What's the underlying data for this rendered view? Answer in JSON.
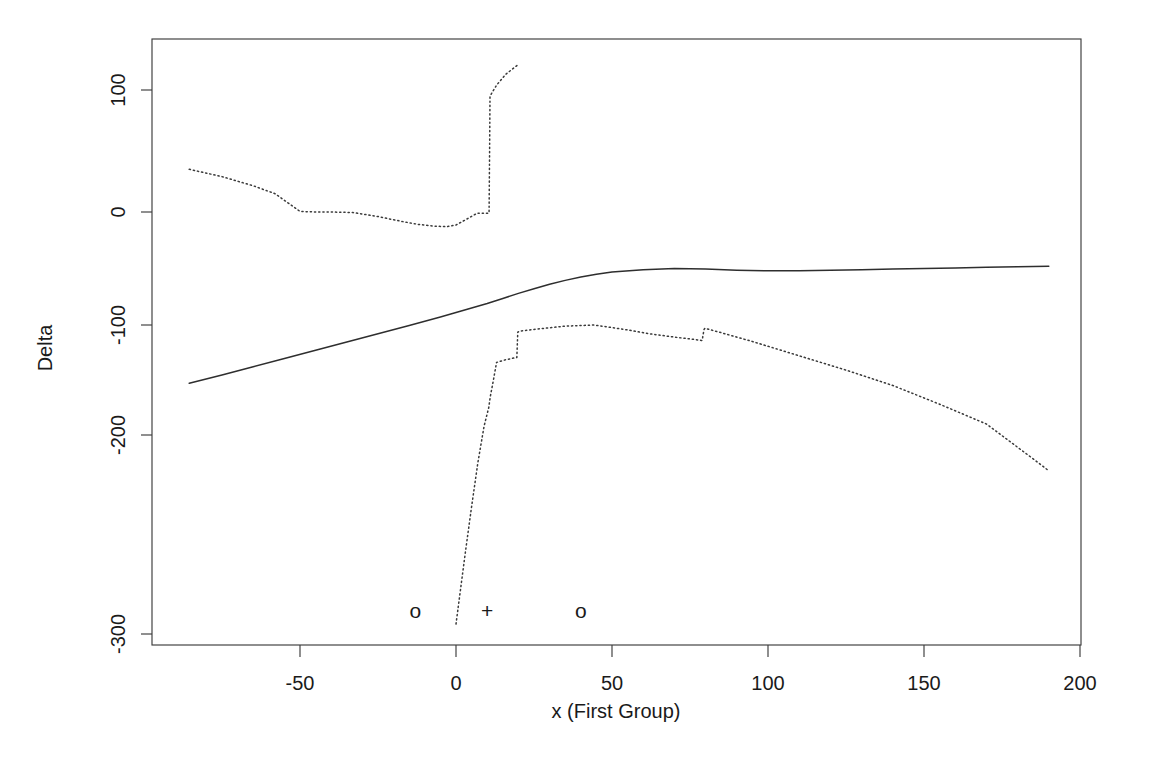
{
  "chart_data": {
    "type": "line",
    "title": "",
    "xlabel": "x (First Group)",
    "ylabel": "Delta",
    "xlim": [
      -95,
      203
    ],
    "ylim": [
      -335,
      128
    ],
    "grid": false,
    "legend": "none",
    "xticks": [
      -50,
      0,
      50,
      100,
      150,
      200
    ],
    "xtick_labels": [
      "-50",
      "0",
      "50",
      "100",
      "150",
      "200"
    ],
    "yticks": [
      100,
      0,
      -100,
      -200,
      -300
    ],
    "ytick_labels": [
      "100",
      "0",
      "-100",
      "-200",
      "-300"
    ],
    "series": [
      {
        "name": "estimate",
        "style": "solid",
        "x": [
          -85.5,
          -75,
          -65,
          -55,
          -45,
          -35,
          -25,
          -15,
          -5,
          0,
          5,
          10,
          15,
          20,
          25,
          30,
          35,
          40,
          45,
          50,
          60,
          70,
          80,
          90,
          100,
          110,
          120,
          130,
          140,
          150,
          160,
          170,
          180,
          190
        ],
        "values": [
          -153.0,
          -145.5,
          -138.0,
          -130.5,
          -123.0,
          -115.5,
          -108.0,
          -100.5,
          -93.0,
          -89.0,
          -85.0,
          -81.0,
          -76.5,
          -72.0,
          -68.0,
          -64.0,
          -60.5,
          -57.5,
          -55.0,
          -53.0,
          -51.0,
          -50.0,
          -50.5,
          -51.5,
          -52.0,
          -52.0,
          -51.5,
          -51.0,
          -50.5,
          -50.0,
          -49.5,
          -49.0,
          -48.5,
          -48.0
        ]
      },
      {
        "name": "upper confidence band",
        "style": "dotted",
        "x": [
          -85.5,
          -75,
          -65,
          -58,
          -50,
          -45,
          -40,
          -33,
          -25,
          -18,
          -12,
          -7,
          -3,
          0,
          3,
          6.5,
          6.8,
          9,
          10.6,
          10.8,
          10.9,
          13,
          16,
          20
        ],
        "values": [
          35.0,
          29.0,
          21.5,
          15.0,
          0.5,
          0.0,
          0.0,
          -0.5,
          -4.0,
          -8.0,
          -11.0,
          -12.5,
          -13.0,
          -11.5,
          -7.0,
          -1.5,
          -1.0,
          -1.0,
          -1.0,
          60.0,
          95.0,
          104.0,
          113.0,
          121.0
        ]
      },
      {
        "name": "lower confidence band",
        "style": "dotted",
        "x": [
          0.0,
          1.5,
          3.0,
          5.0,
          7.0,
          9.0,
          10.5,
          11.0,
          12.0,
          13.0,
          16.0,
          19.5,
          19.8,
          20.5,
          25,
          30,
          35,
          40,
          44,
          48,
          55,
          62,
          70,
          76,
          78.6,
          78.9,
          79.5,
          79.8,
          85,
          95,
          110,
          125,
          140,
          155,
          170,
          185,
          190
        ],
        "values": [
          -295.0,
          -277.0,
          -259.0,
          -236.0,
          -214.0,
          -192.0,
          -175.0,
          -165.0,
          -150.0,
          -134.0,
          -131.5,
          -129.5,
          -106.5,
          -105.5,
          -104.0,
          -102.5,
          -101.0,
          -100.5,
          -100.0,
          -101.5,
          -104.5,
          -108.0,
          -111.0,
          -113.0,
          -114.0,
          -114.0,
          -104.0,
          -103.0,
          -107.0,
          -115.0,
          -128.0,
          -141.0,
          -155.0,
          -172.0,
          -190.0,
          -212.0,
          -218.0
        ]
      }
    ],
    "annotations": [
      {
        "label": "o",
        "x": -13,
        "y": -288,
        "name": "observation-marker-left"
      },
      {
        "label": "+",
        "x": 10,
        "y": -288,
        "name": "observation-marker-center"
      },
      {
        "label": "o",
        "x": 40,
        "y": -288,
        "name": "observation-marker-right"
      }
    ]
  }
}
